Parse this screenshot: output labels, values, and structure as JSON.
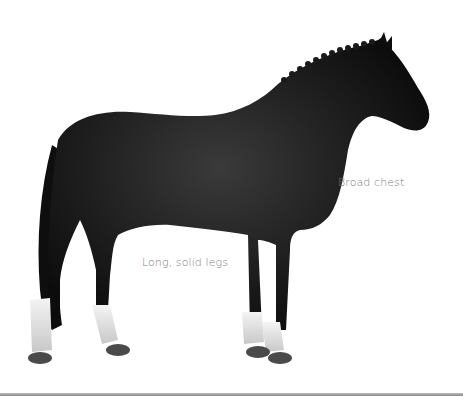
{
  "image": {
    "subject": "horse",
    "coat_color": "#141414",
    "sock_color": "#e8e8e8",
    "hoof_color": "#4a4a4a",
    "background": "#ffffff"
  },
  "annotations": [
    {
      "id": "chest",
      "text": "Broad chest"
    },
    {
      "id": "legs",
      "text": "Long, solid legs"
    }
  ],
  "divider": {
    "color": "#9a9a9a"
  }
}
